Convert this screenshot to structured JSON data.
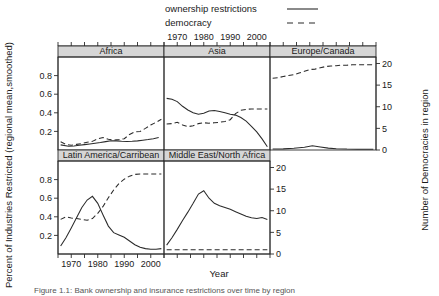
{
  "figure": {
    "caption": "Figure 1.1: Bank ownership and insurance restrictions over time by region",
    "ylabel": "Percent of Industries Restricted (regional mean,smoothed)",
    "ylabel_right": "Number of Democracies in region",
    "xlabel": "Year"
  },
  "legend": {
    "items": [
      {
        "label": "ownership restrictions",
        "style": "solid"
      },
      {
        "label": "democracy",
        "style": "dashed"
      }
    ]
  },
  "axes": {
    "x_ticks": [
      1970,
      1980,
      1990,
      2000
    ],
    "x_tick_labels": [
      "1970",
      "1980",
      "1990",
      "2000"
    ],
    "x_minor_count": 9,
    "x_range": [
      1965,
      2005
    ],
    "y_left_ticks": [
      0.2,
      0.4,
      0.6,
      0.8
    ],
    "y_left_tick_labels": [
      "0.2",
      "0.4",
      "0.6",
      "0.8"
    ],
    "y_left_range": [
      0,
      1
    ],
    "y_right_ticks": [
      0,
      5,
      10,
      15,
      20
    ],
    "y_right_tick_labels": [
      "0",
      "5",
      "10",
      "15",
      "20"
    ],
    "y_right_range": [
      0,
      21.5
    ]
  },
  "chart_data": {
    "type": "line",
    "title": "",
    "xlabel": "Year",
    "ylabel": "Percent of Industries Restricted (regional mean,smoothed)",
    "ylabel_secondary": "Number of Democracies in region",
    "xlim": [
      1965,
      2005
    ],
    "ylim": [
      0,
      1
    ],
    "ylim_secondary": [
      0,
      21.5
    ],
    "grid": false,
    "legend_position": "top-center",
    "layout": {
      "rows": 2,
      "cols": 3,
      "panel_order": [
        "Africa",
        "Asia",
        "Europe/Canada",
        "Latin America/Carribean",
        "Middle East/North Africa"
      ]
    },
    "panels": [
      {
        "name": "Africa",
        "row": 0,
        "col": 0,
        "series": [
          {
            "name": "ownership restrictions",
            "style": "solid",
            "axis": "left",
            "x": [
              1966,
              1969,
              1971,
              1973,
              1975,
              1977,
              1979,
              1981,
              1983,
              1985,
              1987,
              1989,
              1991,
              1993,
              1995,
              1997,
              1999,
              2001,
              2003
            ],
            "values": [
              0.055,
              0.04,
              0.042,
              0.05,
              0.058,
              0.065,
              0.073,
              0.08,
              0.09,
              0.1,
              0.098,
              0.094,
              0.092,
              0.094,
              0.098,
              0.105,
              0.112,
              0.122,
              0.135
            ]
          },
          {
            "name": "democracy",
            "style": "dashed",
            "axis": "right",
            "x": [
              1966,
              1968,
              1970,
              1972,
              1974,
              1976,
              1978,
              1980,
              1982,
              1984,
              1986,
              1988,
              1990,
              1992,
              1994,
              1996,
              1998,
              2000,
              2002,
              2004
            ],
            "values": [
              1.9,
              1.3,
              1.1,
              1.3,
              1.5,
              1.8,
              2.0,
              2.6,
              2.9,
              2.5,
              2.3,
              2.4,
              2.6,
              3.6,
              4.2,
              4.3,
              5.0,
              5.8,
              6.4,
              7.1
            ]
          }
        ]
      },
      {
        "name": "Asia",
        "row": 0,
        "col": 1,
        "series": [
          {
            "name": "ownership restrictions",
            "style": "solid",
            "axis": "left",
            "x": [
              1966,
              1968,
              1970,
              1972,
              1974,
              1976,
              1978,
              1980,
              1982,
              1984,
              1986,
              1988,
              1990,
              1992,
              1994,
              1996,
              1998,
              2000,
              2002,
              2004
            ],
            "values": [
              0.555,
              0.545,
              0.52,
              0.47,
              0.43,
              0.4,
              0.385,
              0.395,
              0.42,
              0.425,
              0.415,
              0.4,
              0.385,
              0.375,
              0.35,
              0.31,
              0.255,
              0.195,
              0.12,
              0.035
            ]
          },
          {
            "name": "democracy",
            "style": "dashed",
            "axis": "right",
            "x": [
              1966,
              1968,
              1970,
              1972,
              1974,
              1976,
              1978,
              1980,
              1982,
              1984,
              1986,
              1988,
              1990,
              1992,
              1994,
              1996,
              1998,
              2000,
              2002,
              2004
            ],
            "values": [
              6.0,
              6.1,
              6.4,
              5.8,
              5.4,
              5.6,
              6.1,
              6.3,
              6.2,
              6.3,
              6.4,
              6.6,
              7.0,
              8.4,
              9.2,
              9.4,
              9.5,
              9.5,
              9.5,
              9.5
            ]
          }
        ]
      },
      {
        "name": "Europe/Canada",
        "row": 0,
        "col": 2,
        "series": [
          {
            "name": "ownership restrictions",
            "style": "solid",
            "axis": "left",
            "x": [
              1966,
              1970,
              1974,
              1978,
              1981,
              1984,
              1987,
              1990,
              1994,
              1998,
              2002,
              2004
            ],
            "values": [
              0.01,
              0.012,
              0.018,
              0.03,
              0.045,
              0.032,
              0.02,
              0.014,
              0.01,
              0.009,
              0.008,
              0.008
            ]
          },
          {
            "name": "democracy",
            "style": "dashed",
            "axis": "right",
            "x": [
              1966,
              1968,
              1970,
              1972,
              1974,
              1976,
              1978,
              1980,
              1982,
              1984,
              1986,
              1988,
              1990,
              1992,
              1994,
              1996,
              1998,
              2000,
              2002,
              2004
            ],
            "values": [
              16.6,
              16.7,
              17.0,
              17.2,
              17.4,
              17.8,
              18.2,
              18.6,
              18.7,
              19.0,
              19.3,
              19.4,
              19.5,
              19.6,
              19.6,
              19.7,
              19.7,
              19.7,
              19.7,
              19.7
            ]
          }
        ]
      },
      {
        "name": "Latin America/Carribean",
        "row": 1,
        "col": 0,
        "series": [
          {
            "name": "ownership restrictions",
            "style": "solid",
            "axis": "left",
            "x": [
              1966,
              1968,
              1970,
              1972,
              1974,
              1976,
              1978,
              1980,
              1982,
              1984,
              1986,
              1988,
              1990,
              1992,
              1994,
              1996,
              1998,
              2000,
              2002,
              2004
            ],
            "values": [
              0.085,
              0.175,
              0.28,
              0.39,
              0.5,
              0.58,
              0.62,
              0.545,
              0.42,
              0.3,
              0.23,
              0.205,
              0.18,
              0.14,
              0.1,
              0.072,
              0.058,
              0.052,
              0.052,
              0.058
            ]
          },
          {
            "name": "democracy",
            "style": "dashed",
            "axis": "right",
            "x": [
              1966,
              1968,
              1970,
              1972,
              1974,
              1976,
              1978,
              1980,
              1982,
              1984,
              1986,
              1988,
              1990,
              1992,
              1994,
              1996,
              1998,
              2000,
              2002,
              2004
            ],
            "values": [
              8.0,
              8.6,
              8.3,
              8.2,
              8.0,
              7.8,
              8.2,
              9.4,
              11.0,
              13.0,
              14.8,
              16.3,
              17.3,
              18.0,
              18.4,
              18.5,
              18.5,
              18.5,
              18.5,
              18.5
            ]
          }
        ]
      },
      {
        "name": "Middle East/North Africa",
        "row": 1,
        "col": 1,
        "series": [
          {
            "name": "ownership restrictions",
            "style": "solid",
            "axis": "left",
            "x": [
              1966,
              1968,
              1970,
              1972,
              1974,
              1976,
              1978,
              1980,
              1982,
              1984,
              1986,
              1988,
              1990,
              1992,
              1994,
              1996,
              1998,
              2000,
              2002,
              2004
            ],
            "values": [
              0.095,
              0.175,
              0.265,
              0.36,
              0.45,
              0.545,
              0.645,
              0.68,
              0.6,
              0.545,
              0.52,
              0.5,
              0.48,
              0.455,
              0.43,
              0.405,
              0.39,
              0.382,
              0.392,
              0.372
            ]
          },
          {
            "name": "democracy",
            "style": "dashed",
            "axis": "right",
            "x": [
              1966,
              1972,
              1978,
              1984,
              1990,
              1996,
              2000,
              2004
            ],
            "values": [
              1.0,
              1.0,
              1.0,
              1.0,
              1.0,
              1.0,
              1.0,
              1.0
            ]
          }
        ]
      }
    ]
  }
}
